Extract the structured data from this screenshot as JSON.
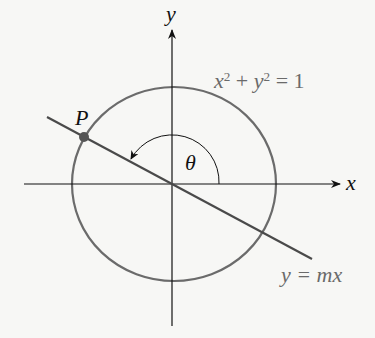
{
  "diagram": {
    "labels": {
      "y_axis": "y",
      "x_axis": "x",
      "circle_equation": {
        "x": "x",
        "exp1": "2",
        "plus": " + ",
        "y": "y",
        "exp2": "2",
        "eq": " = 1"
      },
      "point": "P",
      "angle": "θ",
      "line_equation": "y = mx"
    },
    "colors": {
      "axes": "#111111",
      "circle": "#6b6b6b",
      "line": "#4a4a4a",
      "point": "#555555",
      "label_gray": "#6a6a6a"
    }
  }
}
